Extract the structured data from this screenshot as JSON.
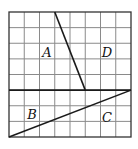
{
  "figure": {
    "grid": {
      "rows": 8,
      "cols": 8,
      "origin_px": [
        9,
        12
      ],
      "size_px": [
        122,
        125
      ]
    },
    "divider": {
      "name": "horizontal-divider",
      "from_cell": [
        0,
        5
      ],
      "to_cell": [
        8,
        5
      ]
    },
    "segments": [
      {
        "name": "line-ad",
        "from_cell": [
          3,
          0
        ],
        "to_cell": [
          5,
          5
        ]
      },
      {
        "name": "line-bc",
        "from_cell": [
          0,
          8
        ],
        "to_cell": [
          8,
          5
        ]
      }
    ],
    "labels": [
      {
        "id": "A",
        "text": "A",
        "x": 47,
        "y": 57
      },
      {
        "id": "D",
        "text": "D",
        "x": 107,
        "y": 57
      },
      {
        "id": "B",
        "text": "B",
        "x": 32,
        "y": 119
      },
      {
        "id": "C",
        "text": "C",
        "x": 107,
        "y": 122
      }
    ]
  }
}
